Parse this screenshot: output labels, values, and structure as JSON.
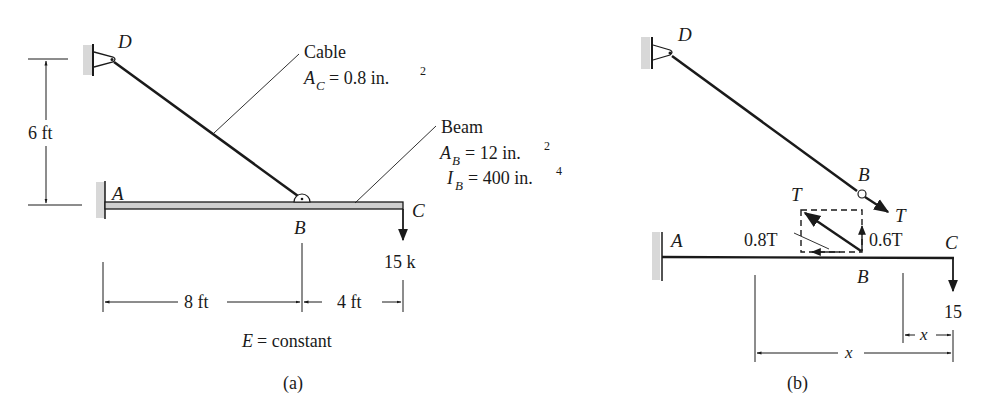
{
  "figure_a": {
    "caption": "(a)",
    "points": {
      "D": "D",
      "A": "A",
      "B": "B",
      "C": "C"
    },
    "cable": {
      "label": "Cable",
      "area_symbol": "A",
      "area_sub": "C",
      "area_value": "= 0.8 in.",
      "area_exp": "2"
    },
    "beam": {
      "label": "Beam",
      "area_symbol": "A",
      "area_sub": "B",
      "area_value": "= 12 in.",
      "area_exp": "2",
      "inertia_symbol": "I",
      "inertia_sub": "B",
      "inertia_value": "= 400 in.",
      "inertia_exp": "4"
    },
    "dimensions": {
      "height": "6 ft",
      "span_ab": "8 ft",
      "span_bc": "4 ft"
    },
    "load": "15 k",
    "modulus_symbol": "E",
    "modulus_text": "= constant"
  },
  "figure_b": {
    "caption": "(b)",
    "points": {
      "D": "D",
      "A": "A",
      "B_top": "B",
      "B_bottom": "B",
      "C": "C"
    },
    "tension_top": "T",
    "tension_cable": "T",
    "horizontal_component": "0.8T",
    "vertical_component": "0.6T",
    "load": "15",
    "x_short": "x",
    "x_long": "x"
  },
  "colors": {
    "ink": "#1a1a1a",
    "wall_hatch": "#d8d8d8",
    "beam_fill": "#cfcfcf"
  }
}
